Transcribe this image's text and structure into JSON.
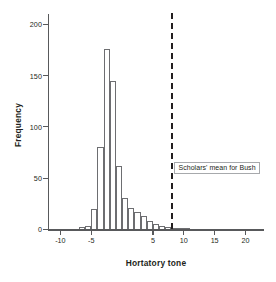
{
  "chart_data": {
    "type": "bar",
    "title": "",
    "xlabel": "Hortatory tone",
    "ylabel": "Frequency",
    "xlim": [
      -12,
      23
    ],
    "ylim": [
      0,
      210
    ],
    "xticks": [
      -10,
      -5,
      5,
      10,
      15,
      20
    ],
    "xticklabels": [
      "-10",
      "-5",
      "5",
      "10",
      "15",
      "20"
    ],
    "yticks": [
      0,
      50,
      100,
      150,
      200
    ],
    "yticklabels": [
      "0",
      "50",
      "100",
      "150",
      "200"
    ],
    "grid": false,
    "legend": null,
    "bin_width": 1,
    "bin_starts": [
      -7,
      -6,
      -5,
      -4,
      -3,
      -2,
      -1,
      0,
      1,
      2,
      3,
      4,
      5,
      6,
      7,
      8,
      9,
      10,
      11,
      12,
      13,
      14
    ],
    "categories": [
      "-7",
      "-6",
      "-5",
      "-4",
      "-3",
      "-2",
      "-1",
      "0",
      "1",
      "2",
      "3",
      "4",
      "5",
      "6",
      "7",
      "8",
      "9",
      "10",
      "11",
      "12",
      "13",
      "14"
    ],
    "values": [
      2,
      3,
      20,
      80,
      176,
      145,
      62,
      31,
      21,
      17,
      13,
      8,
      5,
      3,
      2,
      1,
      1,
      1,
      0,
      0,
      0,
      0
    ],
    "annotations": [
      {
        "name": "scholars-mean-for-bush",
        "text": "Scholars' mean for Bush",
        "x": 8,
        "style": "dashed-vertical-line-with-boxed-label"
      }
    ]
  },
  "axis": {
    "y_title": "Frequency",
    "x_title": "Hortatory tone"
  },
  "colors": {
    "bar_outline": "#6d6e71",
    "bar_fill": "#ffffff",
    "axis": "#58595b",
    "text": "#231f20",
    "annotation_border": "#a7a9ac",
    "reference_line": "#231f20",
    "background": "#ffffff"
  }
}
